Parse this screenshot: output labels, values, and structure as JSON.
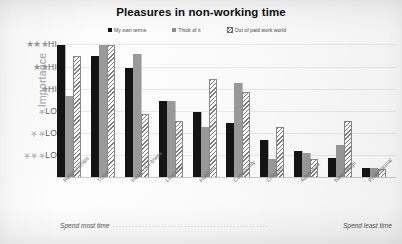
{
  "chart_data": {
    "type": "bar",
    "title": "Pleasures in non-working time",
    "xlabel": "",
    "ylabel": "Importance",
    "grid": true,
    "legend_position": "top",
    "categories": [
      "Relationships",
      "Travel",
      "Health & Fitness",
      "Learning",
      "Hobbies",
      "Community",
      "Creative",
      "Adventure",
      "New things",
      "Professional"
    ],
    "series": [
      {
        "name": "My own terms",
        "color": "#141414",
        "values": [
          6.0,
          5.5,
          5.0,
          3.5,
          3.0,
          2.5,
          1.7,
          1.2,
          0.9,
          0.45
        ]
      },
      {
        "name": "Thick of it",
        "color": "#9a9a9a",
        "values": [
          3.7,
          6.0,
          5.6,
          3.5,
          2.3,
          4.3,
          0.85,
          1.15,
          1.5,
          0.45
        ]
      },
      {
        "name": "Out of paid work world",
        "color": "#ffffff",
        "hatch": "diagonal",
        "values": [
          5.5,
          6.0,
          2.9,
          2.6,
          4.5,
          3.9,
          2.3,
          0.85,
          2.6,
          0.4
        ]
      }
    ],
    "ylim": [
      0,
      6.2
    ],
    "y_ticks_high": [
      {
        "stars": 3,
        "label": "HI"
      },
      {
        "stars": 2,
        "label": "HI"
      },
      {
        "stars": 1,
        "label": "HI"
      }
    ],
    "y_ticks_low": [
      {
        "stars": 1,
        "label": "LO"
      },
      {
        "stars": 2,
        "label": "LO"
      },
      {
        "stars": 3,
        "label": "LO"
      }
    ],
    "star_glyph": "★",
    "footer_left": "Spend most time",
    "footer_right": "Spend least time",
    "footer_dots": "................................................"
  }
}
